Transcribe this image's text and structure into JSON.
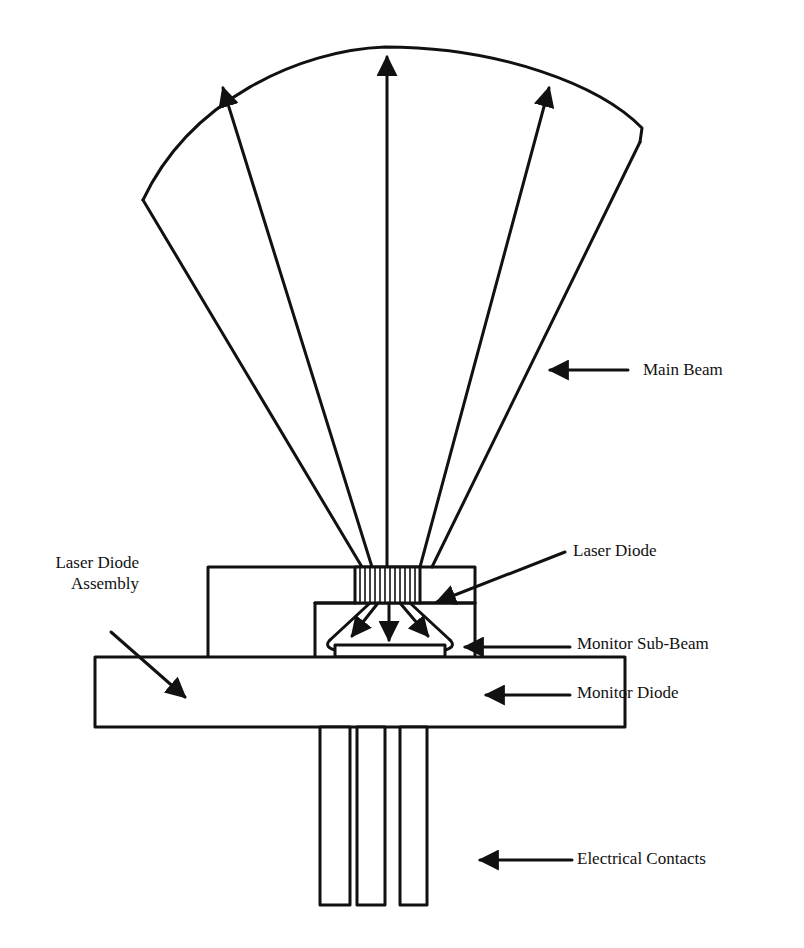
{
  "diagram": {
    "colors": {
      "ink": "#111111",
      "background": "#ffffff"
    },
    "labels": {
      "main_beam": "Main Beam",
      "laser_diode": "Laser Diode",
      "assembly_line1": "Laser Diode",
      "assembly_line2": "Assembly",
      "monitor_sub_beam": "Monitor Sub-Beam",
      "monitor_diode": "Monitor Diode",
      "electrical_contacts": "Electrical Contacts"
    },
    "components": [
      {
        "id": "main-beam",
        "description": "Diverging cone of emission with 3 upward arrows"
      },
      {
        "id": "laser-diode",
        "description": "Striped emitter chip on top of assembly"
      },
      {
        "id": "monitor-sub-beam",
        "description": "Downward diverging rear emission with 3 arrows"
      },
      {
        "id": "monitor-diode",
        "description": "Flat photodiode below the laser"
      },
      {
        "id": "base",
        "description": "Rectangular header base"
      },
      {
        "id": "electrical-contacts",
        "count": 3,
        "description": "Three vertical pins"
      }
    ]
  }
}
